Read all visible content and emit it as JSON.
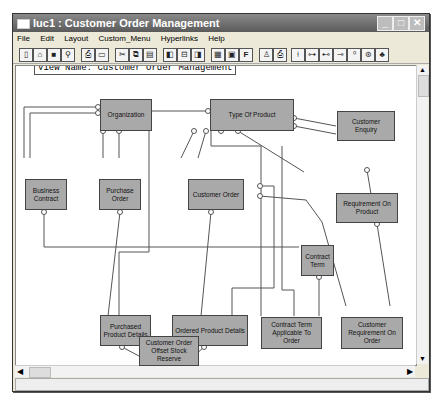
{
  "window": {
    "title": "luc1 : Customer Order Management",
    "controls": [
      "minimize",
      "maximize",
      "close"
    ]
  },
  "menubar": {
    "items": [
      "File",
      "Edit",
      "Layout",
      "Custom_Menu",
      "Hyperlinks",
      "Help"
    ]
  },
  "toolbar": {
    "buttons": [
      "new-icon",
      "open-icon",
      "save-icon",
      "find-icon",
      "print-icon",
      "print-preview-icon",
      "cut-icon",
      "copy-icon",
      "paste-icon",
      "layout-left-icon",
      "layout-center-icon",
      "layout-right-icon",
      "grid-icon",
      "view-icon",
      "font-icon",
      "tool-a-icon",
      "tool-b-icon",
      "tool-c-icon",
      "relation-1-icon",
      "relation-2-icon",
      "relation-3-icon",
      "relation-4-icon",
      "relation-5-icon",
      "relation-6-icon"
    ],
    "labels": {
      "font": "F"
    }
  },
  "canvas": {
    "view_name": "View Name: Customer Order Management",
    "entities": [
      {
        "id": "organization",
        "label": "Organization"
      },
      {
        "id": "type-of-product",
        "label": "Type Of Product"
      },
      {
        "id": "customer-enquiry",
        "label": "Customer Enquiry"
      },
      {
        "id": "business-contract",
        "label": "Business Contract"
      },
      {
        "id": "purchase-order",
        "label": "Purchase Order"
      },
      {
        "id": "customer-order",
        "label": "Customer Order"
      },
      {
        "id": "requirement-on-product",
        "label": "Requirement On Product"
      },
      {
        "id": "contract-term",
        "label": "Contract Term"
      },
      {
        "id": "purchased-product-details",
        "label": "Purchased Product Details"
      },
      {
        "id": "ordered-product-details",
        "label": "Ordered Product Details"
      },
      {
        "id": "contract-term-applicable-to-order",
        "label": "Contract Term Applicable To Order"
      },
      {
        "id": "customer-requirement-on-order",
        "label": "Customer Requirement On Order"
      },
      {
        "id": "customer-order-offset-stock-reserve",
        "label": "Customer Order Offset Stock Reserve"
      }
    ]
  },
  "scrollbars": {
    "up": "▲",
    "down": "▼",
    "left": "◀",
    "right": "▶"
  },
  "colors": {
    "entity_fill": "#a9a9a9",
    "line": "#555555",
    "titlebar": "#6a6a6a"
  }
}
